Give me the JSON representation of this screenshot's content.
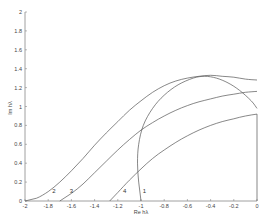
{
  "chart_data": {
    "type": "line",
    "title": "",
    "xlabel": "Re hλ",
    "ylabel": "Im hλ",
    "xlim": [
      -2,
      0
    ],
    "ylim": [
      0,
      2
    ],
    "grid": false,
    "legend": "none (curves labeled inline 1-4)",
    "x_ticks": [
      -2,
      -1.8,
      -1.6,
      -1.4,
      -1.2,
      -1,
      -0.8,
      -0.6,
      -0.4,
      -0.2,
      0
    ],
    "x_tick_labels": [
      "-2",
      "-1.8",
      "-1.6",
      "-1.4",
      "-1.2",
      "-1",
      "-0.8",
      "-0.6",
      "-0.4",
      "-0.2",
      "0"
    ],
    "y_ticks": [
      0,
      0.2,
      0.4,
      0.6,
      0.8,
      1,
      1.2,
      1.4,
      1.6,
      1.8,
      2
    ],
    "y_tick_labels": [
      "0",
      "0.2",
      "0.4",
      "0.6",
      "0.8",
      "1",
      "1.2",
      "1.4",
      "1.6",
      "1.8",
      "2"
    ],
    "series": [
      {
        "name": "1",
        "label_pos": [
          -0.97,
          0.08
        ],
        "x": [
          -1.0,
          -1.02,
          -1.03,
          -1.02,
          -0.98,
          -0.9,
          -0.8,
          -0.68,
          -0.55,
          -0.45,
          -0.35,
          -0.25,
          -0.15,
          -0.05,
          0.0
        ],
        "y": [
          0.0,
          0.2,
          0.4,
          0.6,
          0.8,
          0.98,
          1.12,
          1.23,
          1.3,
          1.32,
          1.3,
          1.25,
          1.17,
          1.06,
          0.98
        ]
      },
      {
        "name": "2",
        "label_pos": [
          -1.75,
          0.08
        ],
        "x": [
          -2.0,
          -1.9,
          -1.8,
          -1.7,
          -1.6,
          -1.5,
          -1.4,
          -1.3,
          -1.2,
          -1.1,
          -1.0,
          -0.9,
          -0.8,
          -0.7,
          -0.6,
          -0.5,
          -0.4,
          -0.3,
          -0.2,
          -0.1,
          0.0
        ],
        "y": [
          0.0,
          0.03,
          0.1,
          0.2,
          0.32,
          0.45,
          0.59,
          0.72,
          0.84,
          0.96,
          1.06,
          1.15,
          1.22,
          1.27,
          1.3,
          1.32,
          1.33,
          1.32,
          1.31,
          1.29,
          1.28
        ]
      },
      {
        "name": "3",
        "label_pos": [
          -1.6,
          0.08
        ],
        "x": [
          -1.7,
          -1.6,
          -1.5,
          -1.4,
          -1.3,
          -1.2,
          -1.1,
          -1.0,
          -0.9,
          -0.8,
          -0.7,
          -0.6,
          -0.5,
          -0.4,
          -0.3,
          -0.2,
          -0.1,
          0.0
        ],
        "y": [
          0.0,
          0.08,
          0.18,
          0.3,
          0.42,
          0.54,
          0.65,
          0.75,
          0.83,
          0.9,
          0.96,
          1.01,
          1.05,
          1.08,
          1.11,
          1.13,
          1.15,
          1.16
        ]
      },
      {
        "name": "4",
        "label_pos": [
          -1.14,
          0.08
        ],
        "x": [
          -1.27,
          -1.2,
          -1.1,
          -1.0,
          -0.9,
          -0.8,
          -0.7,
          -0.6,
          -0.5,
          -0.4,
          -0.3,
          -0.2,
          -0.1,
          0.0,
          0.0
        ],
        "y": [
          0.0,
          0.09,
          0.22,
          0.34,
          0.45,
          0.54,
          0.62,
          0.69,
          0.75,
          0.8,
          0.84,
          0.87,
          0.9,
          0.92,
          0.0
        ]
      }
    ]
  }
}
